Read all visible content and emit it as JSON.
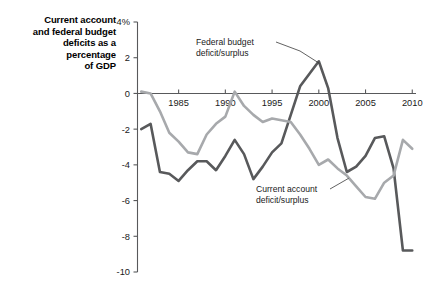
{
  "title": {
    "lines": [
      "Current account",
      "and federal budget",
      "deficits as a",
      "percentage",
      "of GDP"
    ]
  },
  "colors": {
    "federal_line": "#58595b",
    "current_account_line": "#a7a9ac",
    "axis": "#58595b",
    "text": "#1a1a1a",
    "background": "#ffffff"
  },
  "annotations": [
    {
      "name": "federal-budget",
      "lines": [
        "Federal budget",
        "deficit/surplus"
      ],
      "target_year": 2000,
      "target_value": 1.8
    },
    {
      "name": "current-account",
      "lines": [
        "Current account",
        "deficit/surplus"
      ],
      "target_year": 2003,
      "target_value": -4.7
    }
  ],
  "chart_data": {
    "type": "line",
    "title": "Current account and federal budget deficits as a percentage of GDP",
    "xlabel": "",
    "ylabel": "",
    "xlim": [
      1980.6,
      2010.4
    ],
    "ylim": [
      -10,
      4
    ],
    "ytick_values": [
      4,
      2,
      0,
      -2,
      -4,
      -6,
      -8,
      -10
    ],
    "ytick_labels": [
      "4%",
      "2",
      "0",
      "-2",
      "-4",
      "-6",
      "-8",
      "-10"
    ],
    "xtick_values": [
      1985,
      1990,
      1995,
      2000,
      2005,
      2010
    ],
    "xtick_labels": [
      "1985",
      "1990",
      "1995",
      "2000",
      "2005",
      "2010"
    ],
    "grid": false,
    "legend": "annotations",
    "series": [
      {
        "name": "Federal budget deficit/surplus",
        "color": "#58595b",
        "x": [
          1981,
          1982,
          1983,
          1984,
          1985,
          1986,
          1987,
          1988,
          1989,
          1990,
          1991,
          1992,
          1993,
          1994,
          1995,
          1996,
          1997,
          1998,
          1999,
          2000,
          2001,
          2002,
          2003,
          2004,
          2005,
          2006,
          2007,
          2008,
          2009,
          2010
        ],
        "values": [
          -2.0,
          -1.7,
          -4.4,
          -4.5,
          -4.9,
          -4.3,
          -3.8,
          -3.8,
          -4.3,
          -3.5,
          -2.6,
          -3.4,
          -4.8,
          -4.1,
          -3.3,
          -2.8,
          -1.2,
          0.4,
          1.1,
          1.8,
          0.3,
          -2.5,
          -4.4,
          -4.1,
          -3.5,
          -2.5,
          -2.4,
          -4.2,
          -8.8,
          -8.8
        ]
      },
      {
        "name": "Current account deficit/surplus",
        "color": "#a7a9ac",
        "x": [
          1981,
          1982,
          1983,
          1984,
          1985,
          1986,
          1987,
          1988,
          1989,
          1990,
          1991,
          1992,
          1993,
          1994,
          1995,
          1996,
          1997,
          1998,
          1999,
          2000,
          2001,
          2002,
          2003,
          2004,
          2005,
          2006,
          2007,
          2008,
          2009,
          2010
        ],
        "values": [
          0.1,
          0.0,
          -1.0,
          -2.2,
          -2.7,
          -3.3,
          -3.4,
          -2.3,
          -1.7,
          -1.3,
          0.1,
          -0.7,
          -1.2,
          -1.6,
          -1.4,
          -1.5,
          -1.6,
          -2.3,
          -3.1,
          -4.0,
          -3.7,
          -4.2,
          -4.6,
          -5.2,
          -5.8,
          -5.9,
          -5.0,
          -4.6,
          -2.6,
          -3.1
        ]
      }
    ]
  }
}
